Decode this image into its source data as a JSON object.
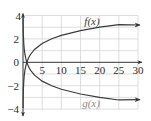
{
  "chart_data": {
    "type": "line",
    "title": "",
    "xlabel": "",
    "ylabel": "",
    "xlim": [
      0,
      30
    ],
    "ylim": [
      -4,
      4
    ],
    "grid": true,
    "grid_step_x": 5,
    "grid_step_y": 1,
    "x_ticks": [
      "5",
      "10",
      "15",
      "20",
      "25",
      "30"
    ],
    "x_tick_values": [
      5,
      10,
      15,
      20,
      25,
      30
    ],
    "y_ticks": [
      "4",
      "2",
      "0",
      "−2",
      "−4"
    ],
    "y_tick_values": [
      4,
      2,
      0,
      -2,
      -4
    ],
    "legend": "inline labels on curves",
    "series": [
      {
        "name": "f(x)",
        "label": "f(x)",
        "color": "#3a3a3a",
        "label_color": "#3a3a3a",
        "x": [
          0.02,
          0.05,
          0.1,
          0.2,
          0.3,
          0.5,
          0.75,
          1,
          1.5,
          2,
          3,
          5,
          7.5,
          10,
          15,
          20,
          25,
          30
        ],
        "values": [
          -3.91,
          -3.0,
          -2.3,
          -1.61,
          -1.2,
          -0.69,
          -0.29,
          0,
          0.41,
          0.69,
          1.1,
          1.61,
          2.01,
          2.3,
          2.71,
          3.0,
          3.22,
          3.4
        ]
      },
      {
        "name": "g(x)",
        "label": "g(x)",
        "color": "#3a3a3a",
        "label_color": "#8a8a8a",
        "x": [
          0.02,
          0.05,
          0.1,
          0.2,
          0.3,
          0.5,
          0.75,
          1,
          1.5,
          2,
          3,
          5,
          7.5,
          10,
          15,
          20,
          25,
          30
        ],
        "values": [
          3.91,
          3.0,
          2.3,
          1.61,
          1.2,
          0.69,
          0.29,
          0,
          -0.41,
          -0.69,
          -1.1,
          -1.61,
          -2.01,
          -2.3,
          -2.71,
          -3.0,
          -3.22,
          -3.4
        ]
      }
    ]
  },
  "colors": {
    "axis": "#333333",
    "grid": "#d4d4d4",
    "tick_text": "#2a2a2a"
  }
}
